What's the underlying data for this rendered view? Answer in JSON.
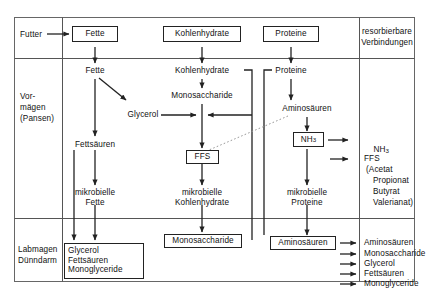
{
  "diagram": {
    "type": "flow-diagram",
    "language": "de",
    "colors": {
      "stroke": "#222222",
      "background": "#ffffff",
      "text": "#111111",
      "dotted_arrow": "#9a9a9a"
    }
  },
  "rows": {
    "header_label": "Futter",
    "row2_label_line1": "Vor-",
    "row2_label_line2": "mägen",
    "row2_label_line3": "(Pansen)",
    "row3_label_line1": "Labmagen",
    "row3_label_line2": "Dünndarm"
  },
  "header": {
    "feed_boxes": [
      {
        "label": "Fette"
      },
      {
        "label": "Kohlenhydrate"
      },
      {
        "label": "Proteine"
      }
    ],
    "right_column_line1": "resorbierbare",
    "right_column_line2": "Verbindungen"
  },
  "rumen": {
    "fat_path": {
      "step1": "Fette",
      "step2": "Glycerol",
      "step3": "Fettsäuren",
      "step4_line1": "mikrobielle",
      "step4_line2": "Fette"
    },
    "carb_path": {
      "step1": "Kohlenhydrate",
      "step2": "Monosaccharide",
      "step3": "FFS",
      "step4_line1": "mikrobielle",
      "step4_line2": "Kohlenhydrate"
    },
    "protein_path": {
      "step1": "Proteine",
      "step2": "Aminosäuren",
      "step3": "NH3",
      "step3_base": "NH",
      "step3_sub": "3",
      "step4_line1": "mikrobielle",
      "step4_line2": "Proteine"
    }
  },
  "absorbable": {
    "nh3_base": "NH",
    "nh3_sub": "3",
    "ffs_label": "FFS",
    "ffs_detail_lines": [
      "(Acetat",
      "Propionat",
      "Butyrat",
      "Valerianat)"
    ]
  },
  "intestine": {
    "fat_box_lines": [
      "Glycerol",
      "Fettsäuren",
      "Monoglyceride"
    ],
    "carb_box_label": "Monosaccharide",
    "protein_box_label": "Aminosäuren",
    "absorbed_list": [
      "Aminosäuren",
      "Monosaccharide",
      "Glycerol",
      "Fettsäuren",
      "Monoglyceride"
    ]
  }
}
